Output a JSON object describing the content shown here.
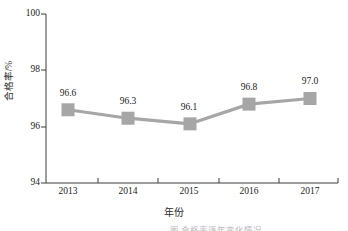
{
  "chart_data": {
    "type": "line",
    "title": "",
    "xlabel": "年份",
    "ylabel": "合格率/%",
    "categories": [
      "2013",
      "2014",
      "2015",
      "2016",
      "2017"
    ],
    "values": [
      96.6,
      96.3,
      96.1,
      96.8,
      97.0
    ],
    "data_labels": [
      "96.6",
      "96.3",
      "96.1",
      "96.8",
      "97.0"
    ],
    "ylim": [
      94,
      100
    ],
    "y_ticks": [
      94,
      96,
      98,
      100
    ],
    "y_tick_labels": [
      "94",
      "96",
      "98",
      "100"
    ],
    "grid": false,
    "legend": null,
    "series_color": "#a6a6a6",
    "marker": "square",
    "axis_color": "#3b3b3b"
  },
  "caption": {
    "text": "图 合格率逐年变化情况"
  }
}
